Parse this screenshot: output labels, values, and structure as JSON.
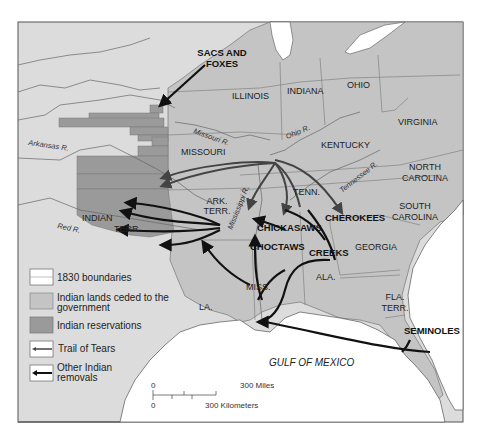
{
  "map": {
    "colors": {
      "background": "#ffffff",
      "unorganized_land": "#dcdcdc",
      "ceded_land": "#c4c4c4",
      "reservations": "#9a9a9a",
      "water": "#ffffff",
      "boundary": "#666666",
      "arrow_trail": "#444444",
      "arrow_other": "#111111"
    },
    "tribes": {
      "sacs_foxes_line1": "SACS AND",
      "sacs_foxes_line2": "FOXES",
      "chickasaws": "CHICKASAWS",
      "choctaws": "CHOCTAWS",
      "cherokees": "CHEROKEES",
      "creeks": "CREEKS",
      "seminoles": "SEMINOLES"
    },
    "states": {
      "illinois": "ILLINOIS",
      "indiana": "INDIANA",
      "ohio": "OHIO",
      "virginia": "VIRGINIA",
      "kentucky": "KENTUCKY",
      "missouri": "MISSOURI",
      "tenn": "TENN.",
      "north_carolina_1": "NORTH",
      "north_carolina_2": "CAROLINA",
      "south_carolina_1": "SOUTH",
      "south_carolina_2": "CAROLINA",
      "ark_terr_1": "ARK.",
      "ark_terr_2": "TERR.",
      "indian_terr_1": "INDIAN",
      "indian_terr_2": "TERR.",
      "georgia": "GEORGIA",
      "ala": "ALA.",
      "miss": "MISS.",
      "la": "LA.",
      "fla_terr_1": "FLA.",
      "fla_terr_2": "TERR."
    },
    "rivers": {
      "arkansas": "Arkansas R.",
      "missouri": "Missouri R.",
      "ohio": "Ohio R.",
      "tennessee": "Tennessee R.",
      "mississippi": "Mississippi R.",
      "red": "Red R."
    },
    "water_label": "GULF OF MEXICO",
    "legend": {
      "items": [
        {
          "label": "1830 boundaries"
        },
        {
          "label_1": "Indian lands ceded to the",
          "label_2": "government"
        },
        {
          "label": "Indian reservations"
        },
        {
          "label": "Trail of Tears"
        },
        {
          "label_1": "Other Indian",
          "label_2": "removals"
        }
      ]
    },
    "scale": {
      "miles_zero": "0",
      "miles_label": "300 Miles",
      "km_zero": "0",
      "km_label": "300 Kilometers"
    }
  }
}
